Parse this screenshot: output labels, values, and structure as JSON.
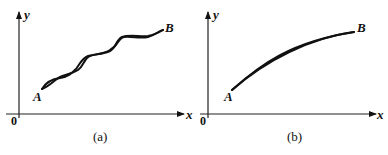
{
  "panels": [
    {
      "id": "a",
      "caption": "(a)",
      "origin_label": "0",
      "x_axis_label": "x",
      "y_axis_label": "y",
      "start_point": "A",
      "end_point": "B",
      "description": "Two curves from A to B oscillating about each other, crossing several times"
    },
    {
      "id": "b",
      "caption": "(b)",
      "origin_label": "0",
      "x_axis_label": "x",
      "y_axis_label": "y",
      "start_point": "A",
      "end_point": "B",
      "description": "Two nearby smooth concave curves from A to B, nearly coincident"
    }
  ]
}
